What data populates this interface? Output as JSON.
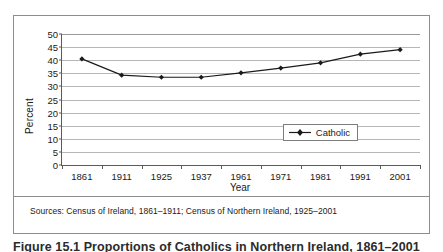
{
  "figure": {
    "source_note": "Sources: Census of Ireland, 1861–1911; Census of Northern Ireland, 1925–2001",
    "caption": "Figure 15.1   Proportions of Catholics in Northern Ireland, 1861–2001",
    "border_color": "#8d8d8d"
  },
  "chart_data": {
    "type": "line",
    "title": "",
    "xlabel": "Year",
    "ylabel": "Percent",
    "categories": [
      "1861",
      "1911",
      "1925",
      "1937",
      "1961",
      "1971",
      "1981",
      "1991",
      "2001"
    ],
    "series": [
      {
        "name": "Catholic",
        "values": [
          40.5,
          34.3,
          33.5,
          33.5,
          35.2,
          37.0,
          39.0,
          42.3,
          44.0
        ],
        "color": "#1a1a1a",
        "marker": "diamond"
      }
    ],
    "ylim": [
      0,
      50
    ],
    "yticks": [
      0,
      5,
      10,
      15,
      20,
      25,
      30,
      35,
      40,
      45,
      50
    ],
    "ytick_labels": [
      "0",
      "5",
      "10",
      "15",
      "20",
      "25",
      "30",
      "35",
      "40",
      "45",
      "50"
    ],
    "grid": true,
    "grid_axis": "y",
    "grid_color": "#b6b6b6",
    "legend": {
      "position": "inside-right",
      "entries": [
        "Catholic"
      ]
    }
  }
}
